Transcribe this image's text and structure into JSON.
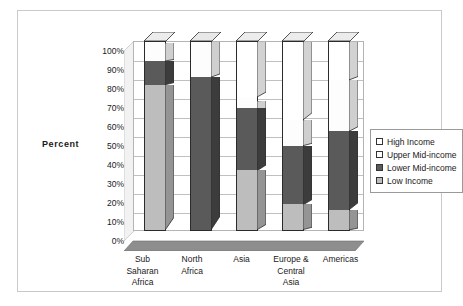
{
  "axis_title": "Percent",
  "legend": {
    "items": [
      {
        "label": "High Income",
        "color": "#ffffff",
        "side": "#d2d2d2",
        "top": "#ececec"
      },
      {
        "label": "Upper Mid-income",
        "color": "#fdfdfd",
        "side": "#cfcfcf",
        "top": "#e8e8e8"
      },
      {
        "label": "Lower Mid-income",
        "color": "#5a5a5a",
        "side": "#3c3c3c",
        "top": "#7e7e7e"
      },
      {
        "label": "Low Income",
        "color": "#bdbdbd",
        "side": "#949494",
        "top": "#d6d6d6"
      }
    ]
  },
  "colors": {
    "high_income": "#ffffff",
    "upper_mid_income": "#fdfdfd",
    "lower_mid_income": "#5a5a5a",
    "low_income": "#bdbdbd",
    "floor": "#8e8e8e",
    "side_wall": "#f2f2f2",
    "grid": "#c0c0c0",
    "outline": "#2b2b2b",
    "frame_border": "#c9c9c9"
  },
  "chart_data": {
    "type": "bar",
    "subtype": "stacked-100-percent-3d",
    "title": "",
    "xlabel": "",
    "ylabel": "Percent",
    "ylim": [
      0,
      100
    ],
    "ytick_labels": [
      "0%",
      "10%",
      "20%",
      "30%",
      "40%",
      "50%",
      "60%",
      "70%",
      "80%",
      "90%",
      "100%"
    ],
    "ytick_values": [
      0,
      10,
      20,
      30,
      40,
      50,
      60,
      70,
      80,
      90,
      100
    ],
    "grid": true,
    "legend_position": "right",
    "categories": [
      "Sub\nSaharan\nAfrica",
      "North\nAfrica",
      "Asia",
      "Europe &\nCentral\nAsia",
      "Americas"
    ],
    "series": [
      {
        "name": "Low Income",
        "values": [
          77,
          0,
          32,
          14,
          11
        ]
      },
      {
        "name": "Lower Mid-income",
        "values": [
          12.5,
          81,
          33,
          31,
          41.5
        ]
      },
      {
        "name": "Upper Mid-income",
        "values": [
          9.5,
          19,
          5.5,
          13.5,
          27
        ]
      },
      {
        "name": "High Income",
        "values": [
          1,
          0,
          29.5,
          41.5,
          20.5
        ]
      }
    ],
    "cumulative_tops": {
      "Sub Saharan Africa": [
        77,
        89.5,
        99,
        100
      ],
      "North Africa": [
        0,
        81,
        100,
        100
      ],
      "Asia": [
        32,
        65,
        70.5,
        100
      ],
      "Europe & Central Asia": [
        14,
        45,
        58.5,
        100
      ],
      "Americas": [
        11,
        52.5,
        79.5,
        100
      ]
    }
  }
}
